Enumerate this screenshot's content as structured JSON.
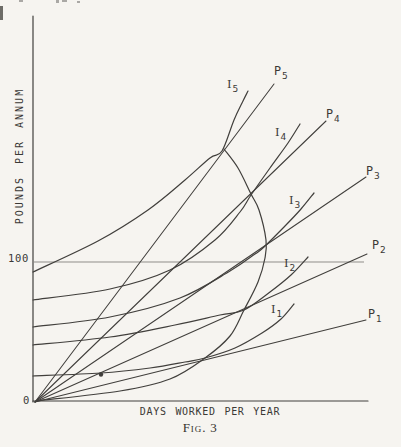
{
  "figure": {
    "y_axis_title": "POUNDS PER ANNUM",
    "x_axis_title": "DAYS  WORKED  PER  YEAR",
    "y_tick_label": "100",
    "origin_label": "0",
    "caption": {
      "label": "Fig.",
      "number": "3"
    }
  },
  "colors": {
    "paper": "#f6f4f0",
    "ink": "#413f3c",
    "reference_line": "#8f8d89"
  },
  "chart_data": {
    "type": "line",
    "title": "Fig. 3",
    "xlabel": "DAYS WORKED PER YEAR",
    "ylabel": "POUNDS PER ANNUM",
    "grid": false,
    "coordinate_space": "figure-pixels (y down, origin of axes at 35,402)",
    "axes": {
      "y_axis": {
        "points": [
          [
            33,
            16
          ],
          [
            33,
            402
          ]
        ]
      },
      "x_axis": {
        "points": [
          [
            33,
            401
          ],
          [
            368,
            401
          ]
        ]
      },
      "y_ticks": [
        {
          "label": "100",
          "y_px": 262
        }
      ],
      "origin": {
        "label": "0",
        "x_px": 35,
        "y_px": 402
      }
    },
    "reference_line": {
      "id": "income-100-line",
      "value": 100,
      "points": [
        [
          34,
          262
        ],
        [
          364,
          262
        ]
      ]
    },
    "series": [
      {
        "id": "P1",
        "role": "wage-line",
        "label_main": "P",
        "label_sub": "1",
        "label_pos": [
          368,
          309
        ],
        "points": [
          [
            35,
            402
          ],
          [
            366,
            320
          ]
        ]
      },
      {
        "id": "P2",
        "role": "wage-line",
        "label_main": "P",
        "label_sub": "2",
        "label_pos": [
          372,
          240
        ],
        "points": [
          [
            35,
            402
          ],
          [
            367,
            254
          ]
        ]
      },
      {
        "id": "P3",
        "role": "wage-line",
        "label_main": "P",
        "label_sub": "3",
        "label_pos": [
          366,
          166
        ],
        "points": [
          [
            35,
            402
          ],
          [
            366,
            177
          ]
        ]
      },
      {
        "id": "P4",
        "role": "wage-line",
        "label_main": "P",
        "label_sub": "4",
        "label_pos": [
          326,
          109
        ],
        "points": [
          [
            35,
            402
          ],
          [
            326,
            121
          ]
        ]
      },
      {
        "id": "P5",
        "role": "wage-line",
        "label_main": "P",
        "label_sub": "5",
        "label_pos": [
          274,
          66
        ],
        "points": [
          [
            35,
            402
          ],
          [
            274,
            84
          ]
        ]
      },
      {
        "id": "I1",
        "role": "indifference-curve",
        "label_main": "I",
        "label_sub": "1",
        "label_pos": [
          271,
          304
        ],
        "points": [
          [
            33,
            376
          ],
          [
            101,
            373
          ],
          [
            150,
            368
          ],
          [
            185,
            362
          ],
          [
            205,
            358
          ],
          [
            235,
            348
          ],
          [
            262,
            333
          ],
          [
            281,
            319
          ],
          [
            294,
            304
          ]
        ]
      },
      {
        "id": "I2",
        "role": "indifference-curve",
        "label_main": "I",
        "label_sub": "2",
        "label_pos": [
          284,
          258
        ],
        "points": [
          [
            33,
            345
          ],
          [
            110,
            337
          ],
          [
            175,
            325
          ],
          [
            220,
            315
          ],
          [
            244,
            310
          ],
          [
            270,
            292
          ],
          [
            291,
            275
          ],
          [
            308,
            257
          ]
        ]
      },
      {
        "id": "I3",
        "role": "indifference-curve",
        "label_main": "I",
        "label_sub": "3",
        "label_pos": [
          289,
          195
        ],
        "points": [
          [
            33,
            327
          ],
          [
            110,
            317
          ],
          [
            180,
            298
          ],
          [
            230,
            271
          ],
          [
            255,
            254
          ],
          [
            264,
            247
          ],
          [
            285,
            226
          ],
          [
            301,
            209
          ],
          [
            314,
            193
          ]
        ]
      },
      {
        "id": "I4",
        "role": "indifference-curve",
        "label_main": "I",
        "label_sub": "4",
        "label_pos": [
          275,
          127
        ],
        "points": [
          [
            33,
            300
          ],
          [
            110,
            289
          ],
          [
            170,
            270
          ],
          [
            215,
            240
          ],
          [
            240,
            212
          ],
          [
            251,
            195
          ],
          [
            270,
            168
          ],
          [
            288,
            143
          ],
          [
            300,
            124
          ]
        ]
      },
      {
        "id": "I5",
        "role": "indifference-curve",
        "label_main": "I",
        "label_sub": "5",
        "label_pos": [
          227,
          79
        ],
        "points": [
          [
            33,
            272
          ],
          [
            98,
            241
          ],
          [
            148,
            210
          ],
          [
            185,
            180
          ],
          [
            210,
            158
          ],
          [
            222,
            151
          ],
          [
            234,
            120
          ],
          [
            243,
            101
          ],
          [
            248,
            91
          ]
        ]
      },
      {
        "id": "locus",
        "role": "supply-locus",
        "label_main": null,
        "label_sub": null,
        "label_pos": null,
        "points": [
          [
            36,
            401
          ],
          [
            120,
            391
          ],
          [
            170,
            379
          ],
          [
            205,
            358
          ],
          [
            230,
            336
          ],
          [
            244,
            310
          ],
          [
            258,
            282
          ],
          [
            265,
            258
          ],
          [
            266,
            240
          ],
          [
            259,
            210
          ],
          [
            251,
            194
          ],
          [
            238,
            168
          ],
          [
            224,
            149
          ]
        ]
      }
    ],
    "point_marker": {
      "id": "dot-marker",
      "x": 101,
      "y": 374.5,
      "r": 2.2
    }
  }
}
